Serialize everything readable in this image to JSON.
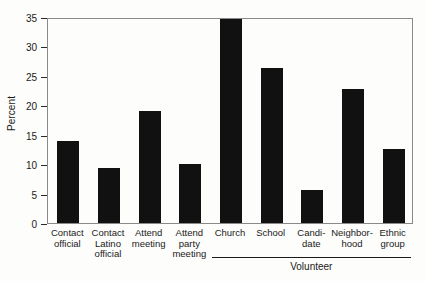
{
  "chart_data": {
    "type": "bar",
    "title": "",
    "xlabel": "",
    "ylabel": "Percent",
    "ylim": [
      0,
      35
    ],
    "yticks": [
      0,
      5,
      10,
      15,
      20,
      25,
      30,
      35
    ],
    "grid": false,
    "legend": null,
    "categories": [
      "Contact\nofficial",
      "Contact\nLatino\nofficial",
      "Attend\nmeeting",
      "Attend\nparty\nmeeting",
      "Church",
      "School",
      "Candi-\ndate",
      "Neighbor-\nhood",
      "Ethnic\ngroup"
    ],
    "values": [
      14.0,
      9.3,
      19.0,
      10.1,
      34.7,
      26.4,
      5.6,
      22.7,
      12.6
    ],
    "group_brackets": [
      {
        "label": "Volunteer",
        "start_category_index": 4,
        "end_category_index": 8
      }
    ],
    "colors": {
      "bar": "#111111",
      "frame": "#8a8a8a",
      "text": "#1a1a1a",
      "background": "#fdfdfb"
    }
  }
}
